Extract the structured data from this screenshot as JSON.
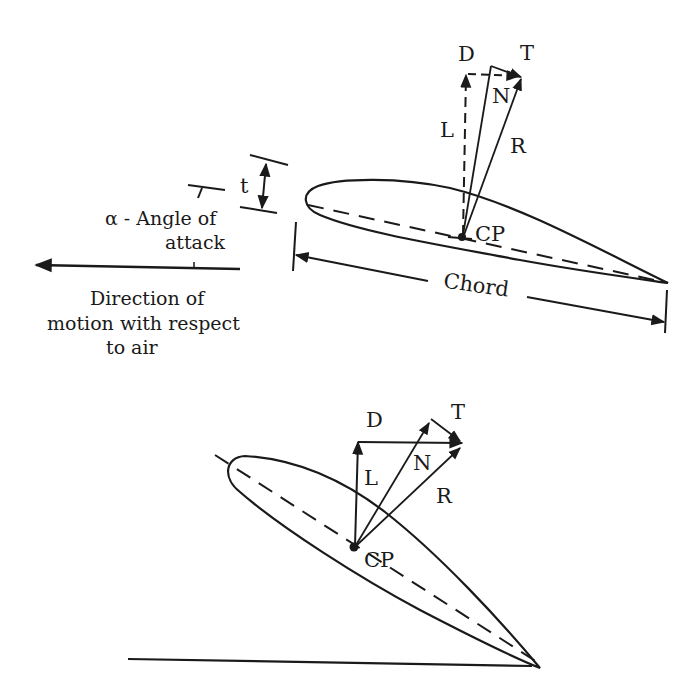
{
  "figure": {
    "top_diagram": {
      "labels": {
        "drag": "D",
        "tangential": "T",
        "lift": "L",
        "normal": "N",
        "resultant": "R",
        "center_of_pressure": "CP",
        "thickness": "t",
        "chord": "Chord",
        "angle_line1": "α - Angle of",
        "angle_line2": "attack",
        "direction_line1": "Direction of",
        "direction_line2": "motion with respect",
        "direction_line3": "to air"
      }
    },
    "bottom_diagram": {
      "labels": {
        "drag": "D",
        "tangential": "T",
        "lift": "L",
        "normal": "N",
        "resultant": "R",
        "center_of_pressure": "CP"
      }
    },
    "colors": {
      "ink": "#1a1a1a",
      "background": "#ffffff"
    }
  }
}
